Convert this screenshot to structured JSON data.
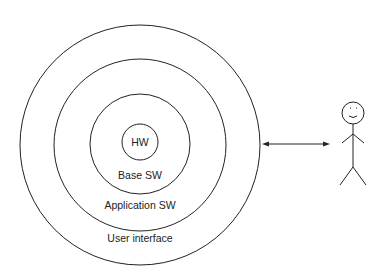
{
  "diagram": {
    "layers": [
      {
        "id": "hw",
        "label": "HW"
      },
      {
        "id": "base-sw",
        "label": "Base SW"
      },
      {
        "id": "application-sw",
        "label": "Application SW"
      },
      {
        "id": "user-interface",
        "label": "User interface"
      }
    ],
    "connector": "bidirectional-arrow",
    "actor": "user-stick-figure",
    "colors": {
      "stroke": "#222222",
      "background": "#ffffff"
    }
  }
}
